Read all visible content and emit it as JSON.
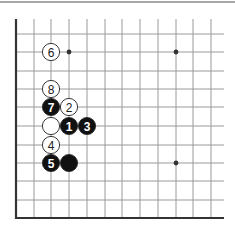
{
  "diagram": {
    "type": "go-board-corner",
    "colors": {
      "background": "#ffffff",
      "grid": "#9a9a9a",
      "edge": "#333333",
      "top_rule": "#8a8a8a",
      "black_stone": "#111111",
      "white_stone": "#ffffff",
      "stone_outline": "#222222",
      "black_label": "#ffffff",
      "white_label": "#222222"
    },
    "grid": {
      "x_lines": [
        16,
        34,
        51,
        69,
        87,
        105,
        122,
        140,
        158,
        176,
        193,
        211
      ],
      "y_lines": [
        34,
        52,
        71,
        89,
        107,
        126,
        145,
        163,
        181,
        200,
        218
      ],
      "top_start": 19,
      "right_end": 224
    },
    "star_points": [
      {
        "x": 69,
        "y": 52
      },
      {
        "x": 176,
        "y": 52
      },
      {
        "x": 176,
        "y": 163
      }
    ],
    "stones": [
      {
        "color": "white",
        "label": "6",
        "x": 51,
        "y": 52
      },
      {
        "color": "white",
        "label": "8",
        "x": 51,
        "y": 89
      },
      {
        "color": "black",
        "label": "7",
        "x": 51,
        "y": 107
      },
      {
        "color": "white",
        "label": "2",
        "x": 69,
        "y": 107
      },
      {
        "color": "white",
        "label": "",
        "x": 51,
        "y": 126
      },
      {
        "color": "black",
        "label": "1",
        "x": 69,
        "y": 126
      },
      {
        "color": "black",
        "label": "3",
        "x": 87,
        "y": 126
      },
      {
        "color": "white",
        "label": "4",
        "x": 51,
        "y": 145
      },
      {
        "color": "black",
        "label": "5",
        "x": 51,
        "y": 163
      },
      {
        "color": "black",
        "label": "",
        "x": 69,
        "y": 163
      }
    ]
  }
}
